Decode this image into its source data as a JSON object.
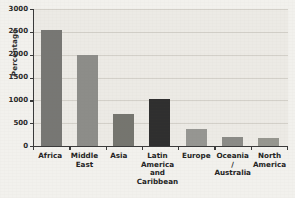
{
  "chart_data": {
    "type": "bar",
    "title": "",
    "xlabel": "",
    "ylabel": "Percentage",
    "ylim": [
      0,
      3000
    ],
    "yticks": [
      0,
      500,
      1000,
      1500,
      2000,
      2500,
      3000
    ],
    "ytick_labels": [
      "0",
      "500",
      "1000",
      "1500",
      "2000",
      "2500",
      "3000"
    ],
    "grid": true,
    "legend": "none",
    "categories": [
      "Africa",
      "Middle East",
      "Asia",
      "Latin America and Caribbean",
      "Europe",
      "Oceania / Australia",
      "North America"
    ],
    "category_label_lines": [
      [
        "Africa"
      ],
      [
        "Middle",
        "East"
      ],
      [
        "Asia"
      ],
      [
        "Latin",
        "America",
        "and",
        "Caribbean"
      ],
      [
        "Europe"
      ],
      [
        "Oceania /",
        "Australia"
      ],
      [
        "North",
        "America"
      ]
    ],
    "values": [
      2550,
      2000,
      710,
      1030,
      370,
      205,
      165
    ],
    "bar_colors": [
      "#777774",
      "#8d8d89",
      "#75756f",
      "#2f2f2f",
      "#969692",
      "#8b8b87",
      "#96968f"
    ]
  },
  "style": {
    "page_background": "#f2f1ed",
    "plot_background": "#eceae5",
    "gridline_color": "#d3d0c9",
    "axis_color": "#3a3a3a",
    "text_color": "#242424"
  }
}
